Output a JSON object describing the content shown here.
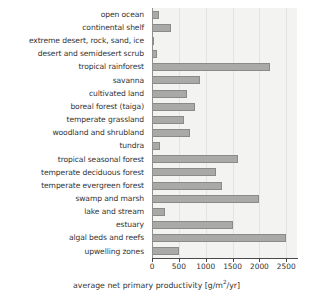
{
  "chart_data": {
    "type": "bar",
    "orientation": "horizontal",
    "title": "",
    "xlabel": "average net primary productivity [g/m2/yr]",
    "ylabel": "",
    "xlim": [
      0,
      2700
    ],
    "xticks": [
      0,
      500,
      1000,
      1500,
      2000,
      2500
    ],
    "xtick_labels": [
      "0",
      "500",
      "1000",
      "1500",
      "2000",
      "2500"
    ],
    "grid": true,
    "legend": "none",
    "categories": [
      "open ocean",
      "continental shelf",
      "extreme desert, rock, sand, ice",
      "desert and semidesert scrub",
      "tropical rainforest",
      "savanna",
      "cultivated land",
      "boreal forest (taiga)",
      "temperate grassland",
      "woodland and shrubland",
      "tundra",
      "tropical seasonal forest",
      "temperate deciduous forest",
      "temperate evergreen forest",
      "swamp and marsh",
      "lake and stream",
      "estuary",
      "algal beds and reefs",
      "upwelling zones"
    ],
    "values": [
      125,
      360,
      3,
      90,
      2200,
      900,
      650,
      800,
      600,
      700,
      140,
      1600,
      1200,
      1300,
      2000,
      250,
      1500,
      2500,
      500
    ],
    "bar_color": "#a9a9a7",
    "bar_edge_color": "#8a8a88",
    "plot_background": "#f3f3f1"
  },
  "axis": {
    "title_prefix": "average net primary productivity [g/m",
    "title_exponent": "2",
    "title_suffix": "/yr]"
  }
}
